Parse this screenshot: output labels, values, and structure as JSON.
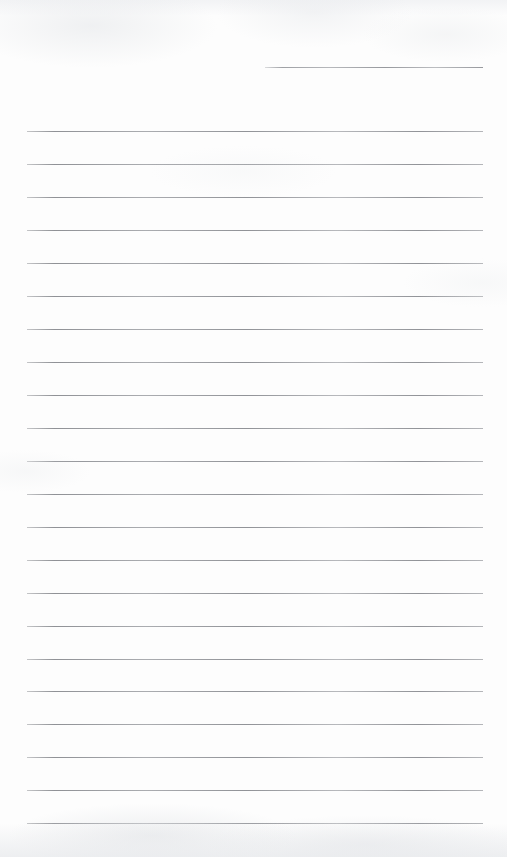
{
  "document": {
    "kind": "scanned-lined-paper",
    "title": "Blank Lined Notepad Page",
    "page_width": 507,
    "page_height": 857,
    "background_color": "#fdfdfd",
    "rule_color": "#8c8e93",
    "content_text": "",
    "has_handwriting": false,
    "has_printed_text": false
  },
  "rules": {
    "left_margin_x": 27,
    "right_margin_x": 483,
    "line_spacing": 33,
    "full_width_count": 22,
    "short_rule_count": 1,
    "total_count": 23,
    "items": [
      {
        "index": 0,
        "name": "signature-rule",
        "type": "short",
        "x": 265,
        "width": 218,
        "y": 67,
        "thickness": 1
      },
      {
        "index": 1,
        "name": "rule-1",
        "type": "full",
        "x": 27,
        "width": 456,
        "y": 131,
        "thickness": 1
      },
      {
        "index": 2,
        "name": "rule-2",
        "type": "full",
        "x": 27,
        "width": 456,
        "y": 164,
        "thickness": 1
      },
      {
        "index": 3,
        "name": "rule-3",
        "type": "full",
        "x": 27,
        "width": 456,
        "y": 197,
        "thickness": 1
      },
      {
        "index": 4,
        "name": "rule-4",
        "type": "full",
        "x": 27,
        "width": 456,
        "y": 230,
        "thickness": 1
      },
      {
        "index": 5,
        "name": "rule-5",
        "type": "full",
        "x": 27,
        "width": 456,
        "y": 263,
        "thickness": 1
      },
      {
        "index": 6,
        "name": "rule-6",
        "type": "full",
        "x": 27,
        "width": 456,
        "y": 296,
        "thickness": 1
      },
      {
        "index": 7,
        "name": "rule-7",
        "type": "full",
        "x": 27,
        "width": 456,
        "y": 329,
        "thickness": 1
      },
      {
        "index": 8,
        "name": "rule-8",
        "type": "full",
        "x": 27,
        "width": 456,
        "y": 362,
        "thickness": 1
      },
      {
        "index": 9,
        "name": "rule-9",
        "type": "full",
        "x": 27,
        "width": 456,
        "y": 395,
        "thickness": 1
      },
      {
        "index": 10,
        "name": "rule-10",
        "type": "full",
        "x": 27,
        "width": 456,
        "y": 428,
        "thickness": 1
      },
      {
        "index": 11,
        "name": "rule-11",
        "type": "full",
        "x": 27,
        "width": 456,
        "y": 461,
        "thickness": 1
      },
      {
        "index": 12,
        "name": "rule-12",
        "type": "full",
        "x": 27,
        "width": 456,
        "y": 494,
        "thickness": 1
      },
      {
        "index": 13,
        "name": "rule-13",
        "type": "full",
        "x": 27,
        "width": 456,
        "y": 527,
        "thickness": 1
      },
      {
        "index": 14,
        "name": "rule-14",
        "type": "full",
        "x": 27,
        "width": 456,
        "y": 560,
        "thickness": 1
      },
      {
        "index": 15,
        "name": "rule-15",
        "type": "full",
        "x": 27,
        "width": 456,
        "y": 593,
        "thickness": 1
      },
      {
        "index": 16,
        "name": "rule-16",
        "type": "full",
        "x": 27,
        "width": 456,
        "y": 626,
        "thickness": 1
      },
      {
        "index": 17,
        "name": "rule-17",
        "type": "full",
        "x": 27,
        "width": 456,
        "y": 659,
        "thickness": 1
      },
      {
        "index": 18,
        "name": "rule-18",
        "type": "full",
        "x": 27,
        "width": 456,
        "y": 691,
        "thickness": 1
      },
      {
        "index": 19,
        "name": "rule-19",
        "type": "full",
        "x": 27,
        "width": 456,
        "y": 724,
        "thickness": 1
      },
      {
        "index": 20,
        "name": "rule-20",
        "type": "full",
        "x": 27,
        "width": 456,
        "y": 757,
        "thickness": 1
      },
      {
        "index": 21,
        "name": "rule-21",
        "type": "full",
        "x": 27,
        "width": 456,
        "y": 790,
        "thickness": 1
      },
      {
        "index": 22,
        "name": "rule-22",
        "type": "full",
        "x": 27,
        "width": 456,
        "y": 823,
        "thickness": 1
      }
    ]
  }
}
